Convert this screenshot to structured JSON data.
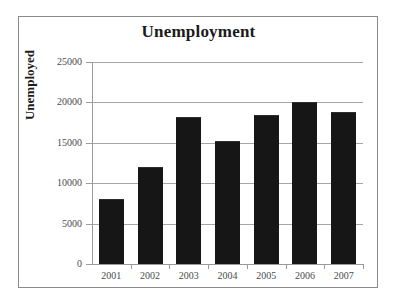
{
  "chart_data": {
    "type": "bar",
    "title": "Unemployment",
    "xlabel": "",
    "ylabel": "Unemployed",
    "categories": [
      "2001",
      "2002",
      "2003",
      "2004",
      "2005",
      "2006",
      "2007"
    ],
    "values": [
      8050,
      12050,
      18150,
      15200,
      18450,
      20100,
      18800
    ],
    "ylim": [
      0,
      25000
    ],
    "yticks": [
      0,
      5000,
      10000,
      15000,
      20000,
      25000
    ],
    "ytick_labels": [
      "0",
      "5000",
      "10000",
      "15000",
      "20000",
      "25000"
    ],
    "grid": true,
    "legend": false,
    "series": [
      {
        "name": "Unemployed",
        "values": [
          8050,
          12050,
          18150,
          15200,
          18450,
          20100,
          18800
        ],
        "color": "#161616"
      }
    ],
    "colors": {
      "bar": "#161616",
      "gridline": "#a6a6a6",
      "axis": "#9a9a9a",
      "frame": "#8a8a8a",
      "title_text": "#1b1b1b",
      "tick_text": "#4a4a4a",
      "background": "#ffffff"
    }
  }
}
